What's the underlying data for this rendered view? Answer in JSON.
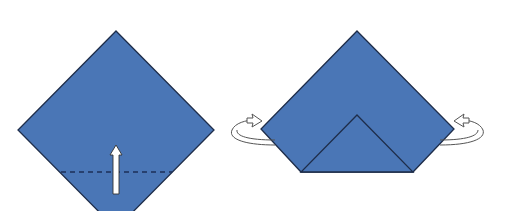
{
  "diagram": {
    "type": "origami-instructions",
    "colors": {
      "paper": "#4a76b6",
      "edge": "#1e2d4a",
      "fold_line": "#1c2f58",
      "arrow_fill": "#ffffff"
    },
    "steps": [
      {
        "id": "step-1",
        "shape": "square-diamond",
        "annotations": [
          {
            "kind": "valley-fold-line",
            "style": "dashed",
            "orientation": "horizontal"
          },
          {
            "kind": "fold-direction-arrow",
            "direction": "up",
            "icon": "arrow-up-icon"
          }
        ]
      },
      {
        "id": "step-2",
        "shape": "bottom-corner-folded-up",
        "annotations": [
          {
            "kind": "turn-over-arrow",
            "side": "left",
            "icon": "rotate-arrow-icon"
          },
          {
            "kind": "turn-over-arrow",
            "side": "right",
            "icon": "rotate-arrow-icon"
          }
        ]
      }
    ]
  }
}
